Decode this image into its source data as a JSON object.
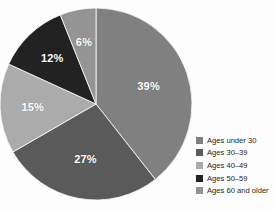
{
  "chart_data": {
    "type": "pie",
    "title": "",
    "subtitle": "",
    "xlabel": "",
    "ylabel": "",
    "grid": false,
    "legend_position": "right-bottom",
    "start_angle_deg": 0,
    "direction": "clockwise",
    "categories": [
      "Ages under 30",
      "Ages 30–39",
      "Ages 40–49",
      "Ages 50–59",
      "Ages 60 and older"
    ],
    "values": [
      39,
      27,
      15,
      12,
      6
    ],
    "value_unit": "%",
    "data_labels": [
      "39%",
      "27%",
      "15%",
      "12%",
      "6%"
    ],
    "colors": [
      "#808080",
      "#5a5a5a",
      "#ababab",
      "#222222",
      "#949494"
    ],
    "slices": [
      {
        "label": "Ages under 30",
        "value": 39,
        "data_label": "39%",
        "color": "#808080"
      },
      {
        "label": "Ages 30–39",
        "value": 27,
        "data_label": "27%",
        "color": "#5a5a5a"
      },
      {
        "label": "Ages 40–49",
        "value": 15,
        "data_label": "15%",
        "color": "#ababab"
      },
      {
        "label": "Ages 50–59",
        "value": 12,
        "data_label": "12%",
        "color": "#222222"
      },
      {
        "label": "Ages 60 and older",
        "value": 6,
        "data_label": "6%",
        "color": "#949494"
      }
    ]
  },
  "legend": {
    "items": [
      {
        "label": "Ages under 30",
        "color": "#808080"
      },
      {
        "label": "Ages 30–39",
        "color": "#5a5a5a"
      },
      {
        "label": "Ages 40–49",
        "color": "#ababab"
      },
      {
        "label": "Ages 50–59",
        "color": "#222222"
      },
      {
        "label": "Ages 60 and older",
        "color": "#949494"
      }
    ]
  },
  "background_color": "#fdfdfd",
  "label_text_color": "#ffffff"
}
